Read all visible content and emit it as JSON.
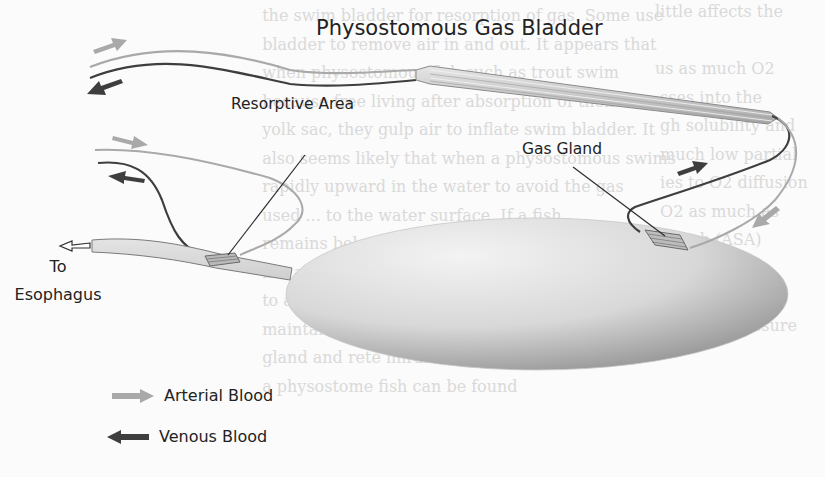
{
  "figure": {
    "title": "Physostomous Gas Bladder",
    "labels": {
      "resorptive_area": "Resorptive Area",
      "gas_gland": "Gas Gland",
      "to_esophagus_line1": "To",
      "to_esophagus_line2": "Esophagus"
    },
    "legend": [
      {
        "icon": "arrow-right-icon",
        "label": "Arterial Blood",
        "color": "#a9a9a9"
      },
      {
        "icon": "arrow-left-icon",
        "label": "Venous Blood",
        "color": "#3e3e3e"
      }
    ],
    "colors": {
      "arterial": "#a9a9a9",
      "venous": "#3e3e3e",
      "bladder_light": "#ececec",
      "bladder_dark": "#9a9a9a",
      "text": "#222222"
    }
  },
  "bleed_through_text": {
    "left_column": "little affects the\n\nus as much O2\n sses into the\n gh solubility and\n much low partial\n ies to O2 diffusion\n O2 as much as\n lymph (ASA)\n a local flux\n the membranes\n arterial pressure",
    "right_column": "  the swim bladder for resorption of gas. Some use\n  bladder to remove air in and out. It appears that\n  when physostomous fish such as trout swim\n  because free living after absorption of their\n  yolk sac, they gulp air to inflate swim bladder. It\n  also seems likely that when a physostomous swims\n  rapidly upward in the water to avoid the gas\n  used ... to the water surface. If a fish\n  remains below 3 or 4 m,\n  not able to fill the swim bladder\n  to above 1 atm (see Fig. 1). The fish would not be\n  maintained through the duct but only with a gas\n  gland and rete mirabile. The depth to which\n  a physostome fish can be found"
  }
}
